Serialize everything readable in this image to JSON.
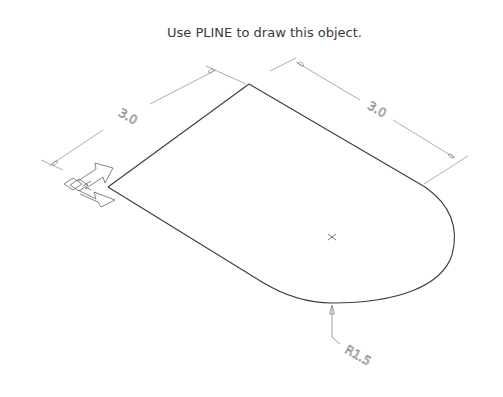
{
  "instruction": "Use PLINE to draw this object.",
  "drawing": {
    "type": "isometric-plate-with-rounded-end",
    "dimensions": {
      "left_edge_length": "3.0",
      "top_edge_length": "3.0",
      "radius": "R1.5"
    },
    "markers": {
      "arc_center": "center-mark-x",
      "ucs_icon": "ucs-axis-icon"
    },
    "colors": {
      "object_line": "#3c3c3c",
      "dimension_line": "#8a8a8a",
      "text": "#3a3a3a"
    }
  }
}
